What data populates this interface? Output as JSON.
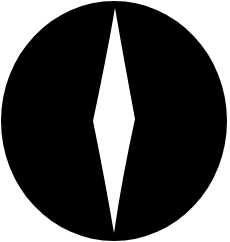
{
  "icon": {
    "name": "eye-slit-icon",
    "colors": {
      "background": "#ffffff",
      "disc": "#000000",
      "slit": "#ffffff"
    }
  }
}
